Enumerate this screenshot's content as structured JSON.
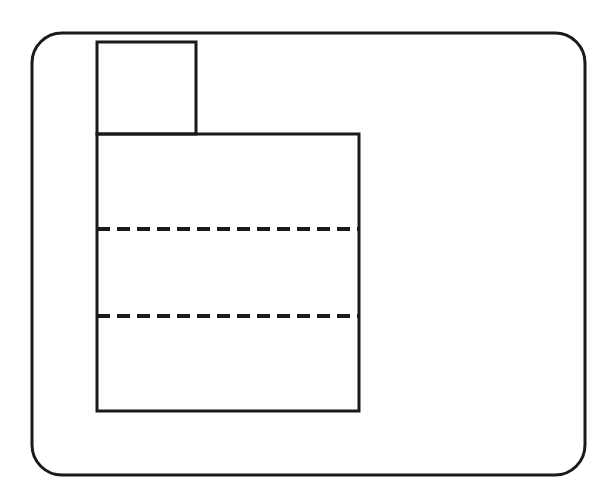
{
  "figure": {
    "background_color": "#ffffff",
    "line_color": "#1a1a1a",
    "fill_color": "#ffffff",
    "canvas": {
      "width": 616,
      "height": 502
    }
  },
  "frame": {
    "name": "rounded-border",
    "x": 32,
    "y": 33,
    "width": 553,
    "height": 442,
    "corner_radius": 30,
    "stroke_width": 3,
    "stroke_color": "#1a1a1a"
  },
  "shapes": {
    "upper_rectangle": {
      "label": "upper step rectangle",
      "x": 97,
      "y": 42,
      "width": 99,
      "height": 92,
      "stroke_width": 3,
      "stroke_color": "#1a1a1a",
      "fill": "#ffffff"
    },
    "lower_rectangle": {
      "label": "main body rectangle",
      "x": 97,
      "y": 134,
      "width": 262,
      "height": 277,
      "stroke_width": 3,
      "stroke_color": "#1a1a1a",
      "fill": "#ffffff"
    }
  },
  "hidden_lines": [
    {
      "label": "hidden edge upper",
      "x1": 97,
      "y1": 229,
      "x2": 359,
      "y2": 229,
      "stroke_width": 4,
      "stroke_color": "#1a1a1a",
      "dash": "13 7"
    },
    {
      "label": "hidden edge lower",
      "x1": 97,
      "y1": 316,
      "x2": 359,
      "y2": 316,
      "stroke_width": 4,
      "stroke_color": "#1a1a1a",
      "dash": "13 7"
    }
  ],
  "geometry_outline": {
    "description": "Stepped L-profile composed of a narrow upper block sitting on the left portion of a wider lower block",
    "points": [
      [
        97,
        42
      ],
      [
        196,
        42
      ],
      [
        196,
        134
      ],
      [
        359,
        134
      ],
      [
        359,
        411
      ],
      [
        97,
        411
      ]
    ]
  }
}
